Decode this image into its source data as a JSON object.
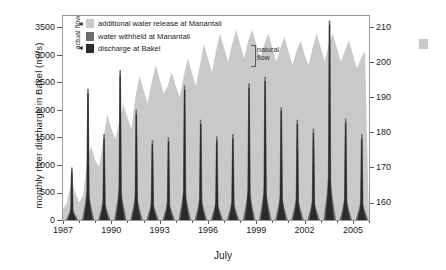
{
  "chart_data": {
    "type": "area",
    "title": "",
    "xlabel": "July",
    "ylabel": "monthly river discharge in Bakel (m3/s)",
    "ylabel_right": "water level in Lake Manantali (m IGN)",
    "xlim": [
      1987,
      2006
    ],
    "ylim": [
      0,
      3700
    ],
    "ylim_right": [
      155,
      213
    ],
    "grid": false,
    "legend_position": "top-left-inside",
    "xticks": [
      1987,
      1990,
      1993,
      1996,
      1999,
      2002,
      2005
    ],
    "xtick_labels": [
      "1987",
      "1990",
      "1993",
      "1996",
      "1999",
      "2002",
      "2005"
    ],
    "yticks": [
      0,
      500,
      1000,
      1500,
      2000,
      2500,
      3000,
      3500
    ],
    "ytick_labels": [
      "0",
      "500",
      "1000",
      "1500",
      "2000",
      "2500",
      "3000",
      "3500"
    ],
    "yticks_right": [
      160,
      170,
      180,
      190,
      200,
      210
    ],
    "ytick_labels_right": [
      "160",
      "170",
      "180",
      "190",
      "200",
      "210"
    ],
    "series": [
      {
        "name": "additional water release at Manantali",
        "color": "#c9c9c9",
        "type": "area",
        "axis": "right",
        "note": "light grey band = water level in Lake Manantali",
        "x": [
          1987.0,
          1987.25,
          1987.5,
          1987.75,
          1988.0,
          1988.25,
          1988.5,
          1988.75,
          1989.0,
          1989.25,
          1989.5,
          1989.75,
          1990.0,
          1990.25,
          1990.5,
          1990.75,
          1991.0,
          1991.25,
          1991.5,
          1991.75,
          1992.0,
          1992.25,
          1992.5,
          1992.75,
          1993.0,
          1993.25,
          1993.5,
          1993.75,
          1994.0,
          1994.25,
          1994.5,
          1994.75,
          1995.0,
          1995.25,
          1995.5,
          1995.75,
          1996.0,
          1996.25,
          1996.5,
          1996.75,
          1997.0,
          1997.25,
          1997.5,
          1997.75,
          1998.0,
          1998.25,
          1998.5,
          1998.75,
          1999.0,
          1999.25,
          1999.5,
          1999.75,
          2000.0,
          2000.25,
          2000.5,
          2000.75,
          2001.0,
          2001.25,
          2001.5,
          2001.75,
          2002.0,
          2002.25,
          2002.5,
          2002.75,
          2003.0,
          2003.25,
          2003.5,
          2003.75,
          2004.0,
          2004.25,
          2004.5,
          2004.75,
          2005.0,
          2005.25,
          2005.5,
          2005.75
        ],
        "values": [
          158,
          160,
          166,
          163,
          160,
          162,
          172,
          176,
          172,
          170,
          178,
          185,
          181,
          178,
          183,
          188,
          184,
          181,
          190,
          196,
          192,
          188,
          194,
          199,
          195,
          191,
          193,
          197,
          193,
          190,
          196,
          201,
          197,
          193,
          199,
          205,
          201,
          197,
          203,
          208,
          204,
          200,
          205,
          209,
          205,
          201,
          206,
          209,
          205,
          201,
          205,
          208,
          204,
          200,
          204,
          207,
          203,
          199,
          203,
          206,
          202,
          199,
          204,
          208,
          204,
          200,
          205,
          208,
          204,
          200,
          203,
          206,
          202,
          198,
          201,
          203
        ]
      },
      {
        "name": "water withheld at Manantali",
        "color": "#6e6e6e",
        "type": "bar",
        "axis": "left",
        "note": "mid-grey portion of spike: natural flow above actual discharge",
        "peaks": [
          {
            "year": 1987,
            "value": 950
          },
          {
            "year": 1988,
            "value": 2380
          },
          {
            "year": 1989,
            "value": 1560
          },
          {
            "year": 1990,
            "value": 2720
          },
          {
            "year": 1991,
            "value": 2000
          },
          {
            "year": 1992,
            "value": 1450
          },
          {
            "year": 1993,
            "value": 1500
          },
          {
            "year": 1994,
            "value": 2440
          },
          {
            "year": 1995,
            "value": 1820
          },
          {
            "year": 1996,
            "value": 1520
          },
          {
            "year": 1997,
            "value": 1560
          },
          {
            "year": 1998,
            "value": 2480
          },
          {
            "year": 1999,
            "value": 2600
          },
          {
            "year": 2000,
            "value": 2050
          },
          {
            "year": 2001,
            "value": 1820
          },
          {
            "year": 2002,
            "value": 1660
          },
          {
            "year": 2003,
            "value": 3620
          },
          {
            "year": 2004,
            "value": 1840
          },
          {
            "year": 2005,
            "value": 1560
          }
        ]
      },
      {
        "name": "discharge at Bakel",
        "color": "#2b2b2b",
        "type": "bar",
        "axis": "left",
        "note": "near-black spikes = measured monthly discharge at Bakel",
        "peaks": [
          {
            "year": 1987,
            "value": 880
          },
          {
            "year": 1988,
            "value": 2300
          },
          {
            "year": 1989,
            "value": 1480
          },
          {
            "year": 1990,
            "value": 2620
          },
          {
            "year": 1991,
            "value": 1920
          },
          {
            "year": 1992,
            "value": 1380
          },
          {
            "year": 1993,
            "value": 1420
          },
          {
            "year": 1994,
            "value": 2360
          },
          {
            "year": 1995,
            "value": 1740
          },
          {
            "year": 1996,
            "value": 1440
          },
          {
            "year": 1997,
            "value": 1480
          },
          {
            "year": 1998,
            "value": 2400
          },
          {
            "year": 1999,
            "value": 2520
          },
          {
            "year": 2000,
            "value": 1980
          },
          {
            "year": 2001,
            "value": 1740
          },
          {
            "year": 2002,
            "value": 1580
          },
          {
            "year": 2003,
            "value": 3540
          },
          {
            "year": 2004,
            "value": 1760
          },
          {
            "year": 2005,
            "value": 1480
          }
        ]
      }
    ]
  },
  "legend": {
    "actual_flow_label": "actual flow",
    "natural_flow_label": "natural\nflow",
    "natural_flow_line1": "natural",
    "natural_flow_line2": "flow",
    "items": [
      {
        "label": "additional water release at Manantali",
        "color": "#c9c9c9"
      },
      {
        "label": "water withheld at Manantali",
        "color": "#6e6e6e"
      },
      {
        "label": "discharge at Bakel",
        "color": "#2b2b2b"
      }
    ]
  },
  "axes": {
    "left_title": "monthly river discharge in Bakel (m³/s)",
    "right_title": "water level in Lake Manantali (m IGN)",
    "x_title": "July"
  },
  "colors": {
    "band": "#c9c9c9",
    "withheld": "#6e6e6e",
    "discharge": "#2b2b2b",
    "frame": "#9a9a9a",
    "text": "#1a1a1a"
  }
}
